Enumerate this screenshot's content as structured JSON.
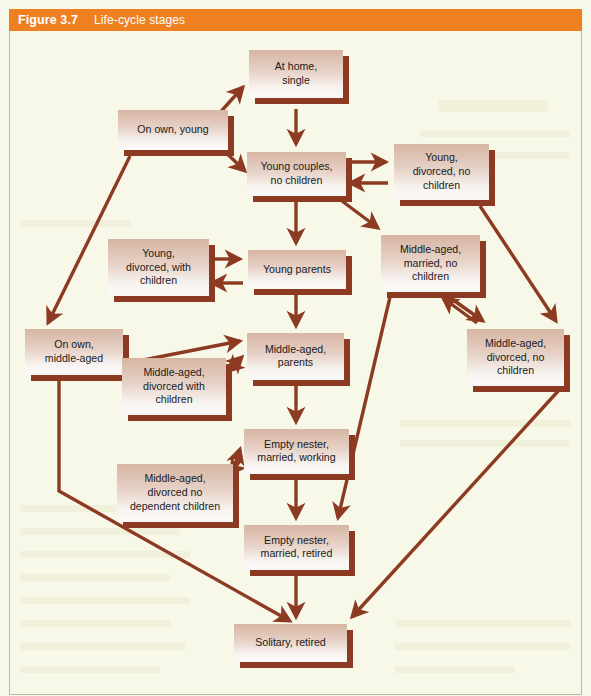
{
  "header": {
    "figure_number": "Figure 3.7",
    "title": "Life-cycle stages",
    "bar_color": "#ef8022",
    "text_color": "#ffffff"
  },
  "canvas": {
    "background_color": "#f8f8e8",
    "box_fill_top": "#d9b9a6",
    "box_fill_bottom": "#f7f2ef",
    "box_shadow_color": "#8c3b22",
    "arrow_color": "#8c3b22",
    "label_color": "#1a1a1a"
  },
  "chart_data": {
    "type": "diagram",
    "title": "Life-cycle stages",
    "nodes": [
      {
        "id": "at-home-single",
        "label": "At home,\nsingle",
        "x": 249,
        "y": 19,
        "w": 94,
        "h": 48
      },
      {
        "id": "on-own-young",
        "label": "On own, young",
        "x": 118,
        "y": 79,
        "w": 110,
        "h": 40
      },
      {
        "id": "young-couples",
        "label": "Young couples,\nno children",
        "x": 247,
        "y": 121,
        "w": 99,
        "h": 44
      },
      {
        "id": "young-divorced-no-children",
        "label": "Young,\ndivorced, no\nchildren",
        "x": 394,
        "y": 113,
        "w": 95,
        "h": 56
      },
      {
        "id": "young-divorced-with-children",
        "label": "Young,\ndivorced, with\nchildren",
        "x": 108,
        "y": 208,
        "w": 101,
        "h": 57
      },
      {
        "id": "young-parents",
        "label": "Young parents",
        "x": 248,
        "y": 219,
        "w": 98,
        "h": 39
      },
      {
        "id": "middle-aged-married-no-children",
        "label": "Middle-aged,\nmarried, no\nchildren",
        "x": 381,
        "y": 204,
        "w": 99,
        "h": 57
      },
      {
        "id": "on-own-middle-aged",
        "label": "On own,\nmiddle-aged",
        "x": 25,
        "y": 298,
        "w": 98,
        "h": 46
      },
      {
        "id": "middle-aged-divorced-with-children",
        "label": "Middle-aged,\ndivorced with\nchildren",
        "x": 122,
        "y": 327,
        "w": 104,
        "h": 57
      },
      {
        "id": "middle-aged-parents",
        "label": "Middle-aged,\nparents",
        "x": 247,
        "y": 302,
        "w": 97,
        "h": 47
      },
      {
        "id": "middle-aged-divorced-no-children",
        "label": "Middle-aged,\ndivorced, no\nchildren",
        "x": 467,
        "y": 298,
        "w": 97,
        "h": 57
      },
      {
        "id": "empty-nester-married-working",
        "label": "Empty nester,\nmarried, working",
        "x": 244,
        "y": 398,
        "w": 105,
        "h": 45
      },
      {
        "id": "middle-aged-divorced-no-dependent-children",
        "label": "Middle-aged,\ndivorced no\ndependent children",
        "x": 117,
        "y": 433,
        "w": 116,
        "h": 58
      },
      {
        "id": "empty-nester-married-retired",
        "label": "Empty nester,\nmarried, retired",
        "x": 244,
        "y": 494,
        "w": 105,
        "h": 45
      },
      {
        "id": "solitary-retired",
        "label": "Solitary, retired",
        "x": 234,
        "y": 593,
        "w": 113,
        "h": 38
      }
    ],
    "edges": [
      {
        "from": "at-home-single",
        "to": "young-couples",
        "path": "M296,78 L296,113",
        "arrow": "down"
      },
      {
        "from": "on-own-young",
        "to": "at-home-single",
        "path": "M216,86 L243,56",
        "arrow": "upright"
      },
      {
        "from": "on-own-young",
        "to": "young-couples",
        "path": "M216,112 L245,140",
        "arrow": "downright"
      },
      {
        "from": "on-own-young",
        "to": "on-own-middle-aged",
        "path": "M130,125 L48,292",
        "arrow": "downleft"
      },
      {
        "from": "young-couples",
        "to": "young-divorced-no-children",
        "path": "M348,131 L386,131",
        "arrow": "right"
      },
      {
        "from": "young-divorced-no-children",
        "to": "young-couples",
        "path": "M388,152 L350,152",
        "arrow": "left"
      },
      {
        "from": "young-couples",
        "to": "young-parents",
        "path": "M296,168 L296,212",
        "arrow": "down"
      },
      {
        "from": "young-couples",
        "to": "middle-aged-married-no-children",
        "path": "M342,170 L378,197",
        "arrow": "downright"
      },
      {
        "from": "young-divorced-no-children",
        "to": "middle-aged-divorced-no-children",
        "path": "M480,175 L556,290",
        "arrow": "downright"
      },
      {
        "from": "young-divorced-with-children",
        "to": "young-parents",
        "path": "M213,228 L240,228",
        "arrow": "right"
      },
      {
        "from": "young-parents",
        "to": "young-divorced-with-children",
        "path": "M243,252 L212,252",
        "arrow": "left"
      },
      {
        "from": "young-parents",
        "to": "middle-aged-parents",
        "path": "M296,261 L296,295",
        "arrow": "down"
      },
      {
        "from": "middle-aged-married-no-children",
        "to": "middle-aged-divorced-no-children",
        "path": "M449,266 L483,290",
        "arrow": "downright"
      },
      {
        "from": "middle-aged-divorced-no-children",
        "to": "middle-aged-married-no-children",
        "path": "M477,292 L443,267",
        "arrow": "upleft"
      },
      {
        "from": "on-own-middle-aged",
        "to": "middle-aged-parents",
        "path": "M123,333 L240,310",
        "arrow": "upright"
      },
      {
        "from": "middle-aged-divorced-with-children",
        "to": "middle-aged-parents",
        "path": "M228,340 L242,326",
        "arrow": "upright"
      },
      {
        "from": "middle-aged-parents",
        "to": "middle-aged-divorced-with-children",
        "path": "M240,329 L228,340",
        "arrow": "downleft"
      },
      {
        "from": "middle-aged-parents",
        "to": "empty-nester-married-working",
        "path": "M296,352 L296,391",
        "arrow": "down"
      },
      {
        "from": "middle-aged-divorced-no-children",
        "to": "solitary-retired",
        "path": "M560,358 L352,586",
        "arrow": "downleft"
      },
      {
        "from": "middle-aged-divorced-no-dependent-children",
        "to": "empty-nester-married-working",
        "path": "M232,443 L240,418",
        "arrow": "upright"
      },
      {
        "from": "empty-nester-married-working",
        "to": "middle-aged-divorced-no-dependent-children",
        "path": "M240,430 L230,443",
        "arrow": "downleft"
      },
      {
        "from": "empty-nester-married-working",
        "to": "empty-nester-married-retired",
        "path": "M296,446 L296,487",
        "arrow": "down"
      },
      {
        "from": "middle-aged-married-no-children",
        "to": "empty-nester-married-retired",
        "path": "M390,266 L338,487",
        "arrow": "downleft"
      },
      {
        "from": "empty-nester-married-retired",
        "to": "solitary-retired",
        "path": "M296,542 L296,586",
        "arrow": "down"
      },
      {
        "from": "on-own-middle-aged",
        "to": "solitary-retired",
        "path": "M59,347 L59,460 L290,590",
        "arrow": "downright"
      }
    ]
  }
}
